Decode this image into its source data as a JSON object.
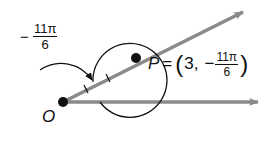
{
  "figure": {
    "angle_label": {
      "sign": "−",
      "numerator": "11π",
      "denominator": "6"
    },
    "origin_label": "O",
    "point": {
      "name": "P",
      "equals": "=",
      "open_paren": "(",
      "r": "3,",
      "theta_sign": "−",
      "theta_numerator": "11π",
      "theta_denominator": "6",
      "close_paren": ")"
    },
    "colors": {
      "ray": "#8a8a8a",
      "ink": "#111111"
    }
  }
}
